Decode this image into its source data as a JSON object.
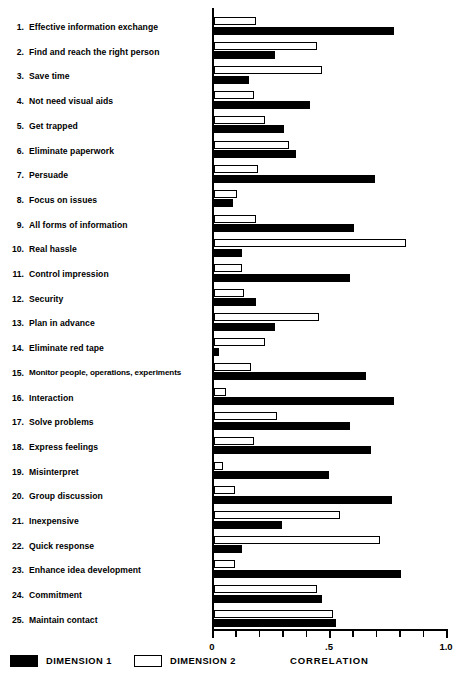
{
  "chart_data": {
    "type": "bar",
    "orientation": "horizontal",
    "title": "",
    "xlabel": "CORRELATION",
    "ylabel": "",
    "xlim": [
      0,
      1.0
    ],
    "xticks": [
      0,
      0.1,
      0.2,
      0.3,
      0.4,
      0.5,
      0.6,
      0.7,
      0.8,
      0.9,
      1.0
    ],
    "xtick_labels": [
      {
        "value": 0,
        "label": "0"
      },
      {
        "value": 0.5,
        "label": ".5"
      },
      {
        "value": 1.0,
        "label": "1.0"
      }
    ],
    "grid": false,
    "legend_position": "bottom-left",
    "categories": [
      "Effective information exchange",
      "Find and reach the right person",
      "Save time",
      "Not need visual aids",
      "Get trapped",
      "Eliminate paperwork",
      "Persuade",
      "Focus on issues",
      "All forms of information",
      "Real hassle",
      "Control impression",
      "Security",
      "Plan in advance",
      "Eliminate red tape",
      "Monitor people, operations, experiments",
      "Interaction",
      "Solve problems",
      "Express feelings",
      "Misinterpret",
      "Group discussion",
      "Inexpensive",
      "Quick response",
      "Enhance idea development",
      "Commitment",
      "Maintain contact"
    ],
    "category_numbers": [
      "1.",
      "2.",
      "3.",
      "4.",
      "5.",
      "6.",
      "7.",
      "8.",
      "9.",
      "10.",
      "11.",
      "12.",
      "13.",
      "14.",
      "15.",
      "16.",
      "17.",
      "18.",
      "19.",
      "20.",
      "21.",
      "22.",
      "23.",
      "24.",
      "25."
    ],
    "series": [
      {
        "name": "DIMENSION 1",
        "color": "#000000",
        "fill": "solid",
        "values": [
          0.77,
          0.26,
          0.15,
          0.41,
          0.3,
          0.35,
          0.69,
          0.08,
          0.6,
          0.12,
          0.58,
          0.18,
          0.26,
          0.02,
          0.65,
          0.77,
          0.58,
          0.67,
          0.49,
          0.76,
          0.29,
          0.12,
          0.8,
          0.46,
          0.52
        ]
      },
      {
        "name": "DIMENSION 2",
        "color": "#ffffff",
        "fill": "outline",
        "values": [
          0.18,
          0.44,
          0.46,
          0.17,
          0.22,
          0.32,
          0.19,
          0.1,
          0.18,
          0.82,
          0.12,
          0.13,
          0.45,
          0.22,
          0.16,
          0.05,
          0.27,
          0.17,
          0.04,
          0.09,
          0.54,
          0.71,
          0.09,
          0.44,
          0.51
        ]
      }
    ]
  },
  "legend": {
    "items": [
      {
        "label": "DIMENSION 1",
        "style": "dim1"
      },
      {
        "label": "DIMENSION 2",
        "style": "dim2"
      }
    ]
  }
}
